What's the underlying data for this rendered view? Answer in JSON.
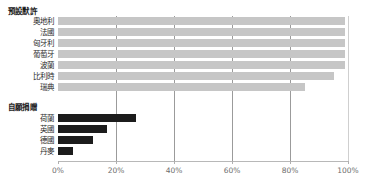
{
  "chart_data": {
    "type": "bar",
    "orientation": "horizontal",
    "title": "",
    "xlabel": "",
    "ylabel": "",
    "xlim": [
      0,
      100
    ],
    "xticks": [
      0,
      20,
      40,
      60,
      80,
      100
    ],
    "xtick_labels": [
      "0%",
      "20%",
      "40%",
      "60%",
      "80%",
      "100%"
    ],
    "grid": true,
    "grid_axis": "x",
    "legend": false,
    "groups": [
      {
        "heading": "預設默許",
        "color": "#c6c6c6",
        "categories": [
          "奧地利",
          "法國",
          "匈牙利",
          "葡萄牙",
          "波蘭",
          "比利時",
          "瑞典"
        ],
        "values": [
          99,
          99,
          99,
          99,
          99,
          95,
          85
        ]
      },
      {
        "heading": "自願捐贈",
        "color": "#1c1c1c",
        "categories": [
          "荷蘭",
          "英國",
          "德國",
          "丹麥"
        ],
        "values": [
          27,
          17,
          12,
          5
        ]
      }
    ]
  },
  "colors": {
    "presumed_consent_bar": "#c6c6c6",
    "voluntary_donation_bar": "#1c1c1c",
    "gridline": "#9b9b9b",
    "axis": "#b8b8b8",
    "tick_label": "#6d6d6d",
    "category_label": "#2b2b2b",
    "heading": "#1a1a1a",
    "background": "#ffffff"
  }
}
